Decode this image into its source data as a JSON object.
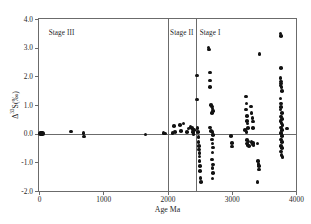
{
  "figure": {
    "background_color": "#ffffff",
    "frame_color": "#6b6b6b",
    "marker_color": "#121212"
  },
  "axis": {
    "x_title": "Age Ma",
    "y_title_prefix": "Δ",
    "y_title_sup": "33",
    "y_title_suffix": "S(‰)",
    "y_title_full": "Δ33S(‰)",
    "x_ticks": [
      "0",
      "1000",
      "2000",
      "3000",
      "4000"
    ],
    "y_ticks": [
      "4.0",
      "3.0",
      "2.0",
      "1.0",
      "0.0",
      "-1.0",
      "-2.0"
    ]
  },
  "stages": [
    {
      "name": "stage-iii",
      "label": "Stage III",
      "x_label_ma": 150
    },
    {
      "name": "stage-ii",
      "label": "Stage II",
      "x_label_ma": 2040
    },
    {
      "name": "stage-i",
      "label": "Stage I",
      "x_label_ma": 2500
    }
  ],
  "dividers_ma": [
    2000,
    2450
  ],
  "chart_data": {
    "type": "scatter",
    "title": "",
    "xlabel": "Age Ma",
    "ylabel": "Δ33S(‰)",
    "xlim": [
      0,
      4000
    ],
    "ylim": [
      -2.0,
      4.0
    ],
    "xticks": [
      0,
      1000,
      2000,
      3000,
      4000
    ],
    "yticks": [
      -2.0,
      -1.0,
      0.0,
      1.0,
      2.0,
      3.0,
      4.0
    ],
    "grid": false,
    "legend": null,
    "annotations": [
      {
        "text": "Stage III",
        "x": 150,
        "y": 3.62
      },
      {
        "text": "Stage II",
        "x": 2040,
        "y": 3.62
      },
      {
        "text": "Stage I",
        "x": 2500,
        "y": 3.62
      }
    ],
    "reference_lines": [
      {
        "orientation": "horizontal",
        "value": 0.0
      },
      {
        "orientation": "vertical",
        "value": 2000
      },
      {
        "orientation": "vertical",
        "value": 2450
      }
    ],
    "points": [
      {
        "x": 30,
        "y": 0.0,
        "size": "big"
      },
      {
        "x": 45,
        "y": 0.0,
        "size": "big"
      },
      {
        "x": 500,
        "y": 0.08
      },
      {
        "x": 690,
        "y": 0.02
      },
      {
        "x": 700,
        "y": -0.1
      },
      {
        "x": 1660,
        "y": -0.03
      },
      {
        "x": 1940,
        "y": 0.02
      },
      {
        "x": 1960,
        "y": 0.0
      },
      {
        "x": 2080,
        "y": 0.02
      },
      {
        "x": 2100,
        "y": 0.26
      },
      {
        "x": 2120,
        "y": 0.06
      },
      {
        "x": 2190,
        "y": 0.3
      },
      {
        "x": 2210,
        "y": 0.1
      },
      {
        "x": 2250,
        "y": 0.36
      },
      {
        "x": 2300,
        "y": 0.06
      },
      {
        "x": 2330,
        "y": 0.18
      },
      {
        "x": 2360,
        "y": 0.24
      },
      {
        "x": 2380,
        "y": 0.2
      },
      {
        "x": 2395,
        "y": 0.14
      },
      {
        "x": 2400,
        "y": 0.05
      },
      {
        "x": 2405,
        "y": -0.02
      },
      {
        "x": 2415,
        "y": 0.12
      },
      {
        "x": 2460,
        "y": 2.03
      },
      {
        "x": 2460,
        "y": 1.19
      },
      {
        "x": 2470,
        "y": 0.2
      },
      {
        "x": 2475,
        "y": 0.05
      },
      {
        "x": 2480,
        "y": -0.12
      },
      {
        "x": 2485,
        "y": -0.3
      },
      {
        "x": 2490,
        "y": -0.42
      },
      {
        "x": 2490,
        "y": -0.55
      },
      {
        "x": 2495,
        "y": -0.68
      },
      {
        "x": 2498,
        "y": -0.8
      },
      {
        "x": 2500,
        "y": -0.95
      },
      {
        "x": 2505,
        "y": -1.12
      },
      {
        "x": 2510,
        "y": -1.3
      },
      {
        "x": 2515,
        "y": -1.55
      },
      {
        "x": 2520,
        "y": -1.68
      },
      {
        "x": 2640,
        "y": 3.0
      },
      {
        "x": 2645,
        "y": 2.93
      },
      {
        "x": 2660,
        "y": 2.14
      },
      {
        "x": 2665,
        "y": 1.85
      },
      {
        "x": 2665,
        "y": 1.63
      },
      {
        "x": 2680,
        "y": 1.0
      },
      {
        "x": 2690,
        "y": 0.95
      },
      {
        "x": 2700,
        "y": 0.88
      },
      {
        "x": 2705,
        "y": 0.8
      },
      {
        "x": 2690,
        "y": 0.72
      },
      {
        "x": 2660,
        "y": 0.22
      },
      {
        "x": 2680,
        "y": 0.1
      },
      {
        "x": 2700,
        "y": 0.05
      },
      {
        "x": 2710,
        "y": -0.05
      },
      {
        "x": 2690,
        "y": -0.2
      },
      {
        "x": 2700,
        "y": -0.35
      },
      {
        "x": 2710,
        "y": -0.48
      },
      {
        "x": 2700,
        "y": -0.66
      },
      {
        "x": 2690,
        "y": -0.9
      },
      {
        "x": 2705,
        "y": -1.08
      },
      {
        "x": 2700,
        "y": -1.2
      },
      {
        "x": 2705,
        "y": -1.38
      },
      {
        "x": 2700,
        "y": -1.56
      },
      {
        "x": 2990,
        "y": -0.08
      },
      {
        "x": 3000,
        "y": -0.32
      },
      {
        "x": 3005,
        "y": -0.45
      },
      {
        "x": 3220,
        "y": 1.3
      },
      {
        "x": 3230,
        "y": 1.05
      },
      {
        "x": 3225,
        "y": 0.85
      },
      {
        "x": 3235,
        "y": 0.62
      },
      {
        "x": 3240,
        "y": 0.45
      },
      {
        "x": 3245,
        "y": 0.35
      },
      {
        "x": 3250,
        "y": 0.2
      },
      {
        "x": 3210,
        "y": 0.12
      },
      {
        "x": 3230,
        "y": 0.05
      },
      {
        "x": 3235,
        "y": -0.22
      },
      {
        "x": 3240,
        "y": -0.35
      },
      {
        "x": 3245,
        "y": -0.4
      },
      {
        "x": 3260,
        "y": -0.28
      },
      {
        "x": 3270,
        "y": -0.42
      },
      {
        "x": 3300,
        "y": 0.95
      },
      {
        "x": 3310,
        "y": 0.72
      },
      {
        "x": 3320,
        "y": 0.55
      },
      {
        "x": 3330,
        "y": 0.42
      },
      {
        "x": 3330,
        "y": 0.2
      },
      {
        "x": 3310,
        "y": -0.3
      },
      {
        "x": 3320,
        "y": -0.38
      },
      {
        "x": 3330,
        "y": -0.32
      },
      {
        "x": 3340,
        "y": -0.4
      },
      {
        "x": 3430,
        "y": 2.78
      },
      {
        "x": 3400,
        "y": -0.35
      },
      {
        "x": 3410,
        "y": -0.95
      },
      {
        "x": 3415,
        "y": -1.05
      },
      {
        "x": 3420,
        "y": -1.12
      },
      {
        "x": 3425,
        "y": -1.25
      },
      {
        "x": 3400,
        "y": -1.68
      },
      {
        "x": 3760,
        "y": 3.5
      },
      {
        "x": 3765,
        "y": 3.4
      },
      {
        "x": 3770,
        "y": 2.3
      },
      {
        "x": 3760,
        "y": 1.95
      },
      {
        "x": 3765,
        "y": 1.82
      },
      {
        "x": 3770,
        "y": 1.75
      },
      {
        "x": 3760,
        "y": 1.68
      },
      {
        "x": 3775,
        "y": 1.62
      },
      {
        "x": 3785,
        "y": 1.48
      },
      {
        "x": 3760,
        "y": 1.22
      },
      {
        "x": 3765,
        "y": 1.05
      },
      {
        "x": 3770,
        "y": 0.92
      },
      {
        "x": 3760,
        "y": 0.85
      },
      {
        "x": 3780,
        "y": 0.72
      },
      {
        "x": 3770,
        "y": 0.6
      },
      {
        "x": 3785,
        "y": 0.52
      },
      {
        "x": 3760,
        "y": 0.45
      },
      {
        "x": 3775,
        "y": 0.38
      },
      {
        "x": 3790,
        "y": 0.3
      },
      {
        "x": 3765,
        "y": 0.22
      },
      {
        "x": 3780,
        "y": 0.12
      },
      {
        "x": 3860,
        "y": 0.18
      },
      {
        "x": 3770,
        "y": 0.02
      },
      {
        "x": 3785,
        "y": -0.08
      },
      {
        "x": 3765,
        "y": -0.2
      },
      {
        "x": 3780,
        "y": -0.3
      },
      {
        "x": 3770,
        "y": -0.42
      },
      {
        "x": 3785,
        "y": -0.5
      },
      {
        "x": 3765,
        "y": -0.62
      },
      {
        "x": 3775,
        "y": -0.75
      },
      {
        "x": 3790,
        "y": -0.82
      }
    ]
  }
}
